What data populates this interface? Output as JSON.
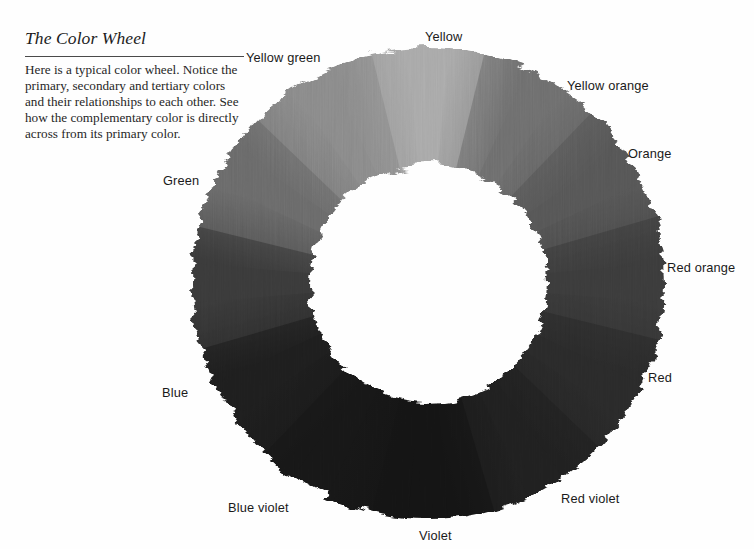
{
  "page": {
    "background_color": "#fefefe",
    "width": 754,
    "height": 549
  },
  "caption": {
    "title": "The Color Wheel",
    "body": "Here is a typical color wheel. Notice the primary, secondary and tertiary colors and their relationships to each other. See how the complementary color is directly across from its primary color.",
    "title_color": "#1c1c1c",
    "body_color": "#262626",
    "rule_color": "#4a4a4a"
  },
  "chart_data": {
    "type": "pie",
    "title": "The Color Wheel",
    "subtype": "donut-color-wheel",
    "render_style": "painted-brush-grayscale",
    "grid": false,
    "legend": "radial-labels",
    "center": {
      "x": 240,
      "y": 250
    },
    "outer_radius": 238,
    "inner_radius": 118,
    "slice_count": 12,
    "slice_degrees": 30,
    "categories": [
      "Yellow",
      "Yellow orange",
      "Orange",
      "Red orange",
      "Red",
      "Red violet",
      "Violet",
      "Blue violet",
      "Blue",
      "Blue green",
      "Green",
      "Yellow green"
    ],
    "values": [
      30,
      30,
      30,
      30,
      30,
      30,
      30,
      30,
      30,
      30,
      30,
      30
    ],
    "segments": [
      {
        "name": "Yellow",
        "start_angle": -15,
        "end_angle": 15,
        "tone": "#a9a9a9",
        "classification": "primary"
      },
      {
        "name": "Yellow orange",
        "start_angle": 15,
        "end_angle": 45,
        "tone": "#6e6e6e",
        "classification": "tertiary"
      },
      {
        "name": "Orange",
        "start_angle": 45,
        "end_angle": 75,
        "tone": "#565656",
        "classification": "secondary"
      },
      {
        "name": "Red orange",
        "start_angle": 75,
        "end_angle": 105,
        "tone": "#3b3b3b",
        "classification": "tertiary"
      },
      {
        "name": "Red",
        "start_angle": 105,
        "end_angle": 135,
        "tone": "#2a2a2a",
        "classification": "primary"
      },
      {
        "name": "Red violet",
        "start_angle": 135,
        "end_angle": 165,
        "tone": "#202020",
        "classification": "tertiary"
      },
      {
        "name": "Violet",
        "start_angle": 165,
        "end_angle": 195,
        "tone": "#141414",
        "classification": "secondary"
      },
      {
        "name": "Blue violet",
        "start_angle": 195,
        "end_angle": 225,
        "tone": "#171717",
        "classification": "tertiary"
      },
      {
        "name": "Blue",
        "start_angle": 225,
        "end_angle": 255,
        "tone": "#1e1e1e",
        "classification": "primary"
      },
      {
        "name": "Blue green",
        "start_angle": 255,
        "end_angle": 285,
        "tone": "#3a3a3a",
        "classification": "tertiary"
      },
      {
        "name": "Green",
        "start_angle": 285,
        "end_angle": 315,
        "tone": "#6a6a6a",
        "classification": "secondary"
      },
      {
        "name": "Yellow green",
        "start_angle": 315,
        "end_angle": 345,
        "tone": "#8a8a8a",
        "classification": "tertiary"
      }
    ],
    "xlabel": "",
    "ylabel": ""
  },
  "labels": [
    {
      "id": "yellow",
      "text": "Yellow",
      "x": 425,
      "y": 29
    },
    {
      "id": "yellow-green",
      "text": "Yellow green",
      "x": 246,
      "y": 50
    },
    {
      "id": "yellow-orange",
      "text": "Yellow orange",
      "x": 567,
      "y": 78
    },
    {
      "id": "orange",
      "text": "Orange",
      "x": 628,
      "y": 146
    },
    {
      "id": "green",
      "text": "Green",
      "x": 163,
      "y": 173
    },
    {
      "id": "red-orange",
      "text": "Red orange",
      "x": 667,
      "y": 260
    },
    {
      "id": "blue",
      "text": "Blue",
      "x": 162,
      "y": 385
    },
    {
      "id": "red",
      "text": "Red",
      "x": 648,
      "y": 370
    },
    {
      "id": "blue-violet",
      "text": "Blue violet",
      "x": 228,
      "y": 500
    },
    {
      "id": "red-violet",
      "text": "Red violet",
      "x": 561,
      "y": 491
    },
    {
      "id": "violet",
      "text": "Violet",
      "x": 419,
      "y": 528
    }
  ]
}
